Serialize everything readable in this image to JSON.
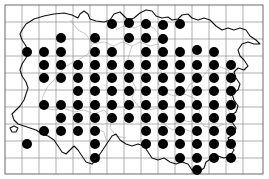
{
  "figure": {
    "kind": "distribution-dot-map",
    "title": "",
    "caption": ""
  },
  "colors": {
    "dot": "#000000",
    "coastline": "#111111",
    "grid": "#8c8c8c",
    "frame": "#6b6b6b",
    "internal_border": "#9a9a9a",
    "background": "#ffffff"
  },
  "grid": {
    "origin_x": 5,
    "origin_y": 5,
    "cell_size": 17,
    "columns": 15,
    "rows": 10,
    "width": 258,
    "height": 169,
    "visible": true
  },
  "symbol": {
    "name": "filled-circle",
    "radius": 5.0,
    "meaning": "presence record"
  },
  "chart_data": {
    "type": "scatter",
    "title": "",
    "xlabel": "",
    "ylabel": "",
    "xlim": [
      5,
      263
    ],
    "ylim": [
      5,
      174
    ],
    "grid": true,
    "legend": null,
    "series": [
      {
        "name": "presence records",
        "marker": "filled-circle",
        "color": "#000000",
        "points": [
          [
            112,
            24
          ],
          [
            129,
            23
          ],
          [
            146,
            24
          ],
          [
            163,
            25
          ],
          [
            180,
            24
          ],
          [
            61,
            38
          ],
          [
            95,
            38
          ],
          [
            129,
            38
          ],
          [
            146,
            38
          ],
          [
            163,
            39
          ],
          [
            27,
            52
          ],
          [
            44,
            52
          ],
          [
            61,
            52
          ],
          [
            95,
            52
          ],
          [
            112,
            52
          ],
          [
            146,
            52
          ],
          [
            163,
            52
          ],
          [
            180,
            52
          ],
          [
            197,
            50
          ],
          [
            214,
            52
          ],
          [
            44,
            65
          ],
          [
            61,
            65
          ],
          [
            78,
            65
          ],
          [
            95,
            65
          ],
          [
            112,
            65
          ],
          [
            129,
            65
          ],
          [
            146,
            65
          ],
          [
            163,
            65
          ],
          [
            180,
            65
          ],
          [
            197,
            65
          ],
          [
            214,
            65
          ],
          [
            231,
            65
          ],
          [
            44,
            78
          ],
          [
            61,
            78
          ],
          [
            78,
            78
          ],
          [
            95,
            78
          ],
          [
            112,
            78
          ],
          [
            129,
            78
          ],
          [
            146,
            78
          ],
          [
            163,
            78
          ],
          [
            180,
            78
          ],
          [
            197,
            78
          ],
          [
            214,
            78
          ],
          [
            231,
            78
          ],
          [
            78,
            91
          ],
          [
            95,
            91
          ],
          [
            112,
            91
          ],
          [
            129,
            91
          ],
          [
            146,
            91
          ],
          [
            163,
            91
          ],
          [
            180,
            91
          ],
          [
            197,
            91
          ],
          [
            214,
            91
          ],
          [
            231,
            91
          ],
          [
            44,
            105
          ],
          [
            61,
            105
          ],
          [
            78,
            105
          ],
          [
            95,
            105
          ],
          [
            112,
            105
          ],
          [
            129,
            105
          ],
          [
            146,
            105
          ],
          [
            163,
            105
          ],
          [
            180,
            105
          ],
          [
            197,
            105
          ],
          [
            214,
            105
          ],
          [
            231,
            105
          ],
          [
            61,
            118
          ],
          [
            78,
            118
          ],
          [
            95,
            118
          ],
          [
            112,
            118
          ],
          [
            129,
            118
          ],
          [
            146,
            118
          ],
          [
            163,
            118
          ],
          [
            180,
            118
          ],
          [
            197,
            118
          ],
          [
            214,
            118
          ],
          [
            231,
            118
          ],
          [
            44,
            131
          ],
          [
            61,
            131
          ],
          [
            78,
            131
          ],
          [
            95,
            131
          ],
          [
            146,
            131
          ],
          [
            163,
            131
          ],
          [
            180,
            131
          ],
          [
            197,
            131
          ],
          [
            214,
            131
          ],
          [
            231,
            131
          ],
          [
            27,
            144
          ],
          [
            95,
            144
          ],
          [
            146,
            144
          ],
          [
            163,
            144
          ],
          [
            180,
            144
          ],
          [
            197,
            144
          ],
          [
            214,
            144
          ],
          [
            231,
            144
          ],
          [
            95,
            158
          ],
          [
            180,
            158
          ],
          [
            197,
            158
          ],
          [
            214,
            158
          ],
          [
            231,
            158
          ],
          [
            197,
            170
          ]
        ],
        "count": 104
      }
    ]
  },
  "accessibility": {
    "alt_text": "A square-gridded distribution map of a region showing filled black circles marking occupied grid squares across most of the territory."
  }
}
